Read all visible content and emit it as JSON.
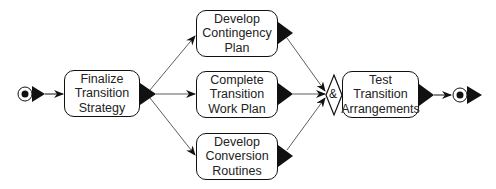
{
  "diagram": {
    "type": "activity-flow",
    "start_node": {
      "label": ""
    },
    "end_node": {
      "label": ""
    },
    "activities": [
      {
        "id": "finalize",
        "lines": [
          "Finalize",
          "Transition",
          "Strategy"
        ]
      },
      {
        "id": "contingency",
        "lines": [
          "Develop",
          "Contingency",
          "Plan"
        ]
      },
      {
        "id": "workplan",
        "lines": [
          "Complete",
          "Transition",
          "Work Plan"
        ]
      },
      {
        "id": "conversion",
        "lines": [
          "Develop",
          "Conversion",
          "Routines"
        ]
      },
      {
        "id": "test",
        "lines": [
          "Test",
          "Transition",
          "Arrangements"
        ]
      }
    ],
    "join": {
      "symbol": "&",
      "type": "and-join"
    },
    "edges": [
      {
        "from": "start",
        "to": "finalize"
      },
      {
        "from": "finalize",
        "to": "contingency"
      },
      {
        "from": "finalize",
        "to": "workplan"
      },
      {
        "from": "finalize",
        "to": "conversion"
      },
      {
        "from": "contingency",
        "to": "join"
      },
      {
        "from": "workplan",
        "to": "join"
      },
      {
        "from": "conversion",
        "to": "join"
      },
      {
        "from": "join",
        "to": "test"
      },
      {
        "from": "test",
        "to": "end"
      }
    ],
    "colors": {
      "stroke": "#111111",
      "fill": "#ffffff",
      "text": "#222222"
    }
  }
}
